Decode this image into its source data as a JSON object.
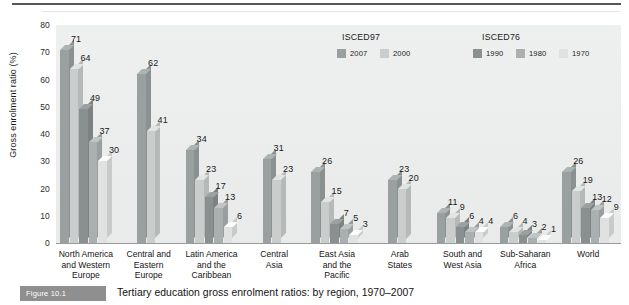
{
  "figure": {
    "caption_badge": "Figure 10.1",
    "caption_text": "Tertiary education gross enrolment ratios: by region, 1970–2007"
  },
  "legend": {
    "groups": [
      {
        "title": "ISCED97",
        "items": [
          {
            "label": "2007",
            "color": "#9aa0a0"
          },
          {
            "label": "2000",
            "color": "#c9cdcc"
          }
        ]
      },
      {
        "title": "ISCED76",
        "items": [
          {
            "label": "1990",
            "color": "#8a8f8f"
          },
          {
            "label": "1980",
            "color": "#aab0af"
          },
          {
            "label": "1970",
            "color": "#dfe2e1"
          }
        ]
      }
    ]
  },
  "chart_data": {
    "type": "bar",
    "title": "Tertiary education gross enrolment ratios: by region, 1970–2007",
    "xlabel": "",
    "ylabel": "Gross enrolment ratio (%)",
    "ylim": [
      0,
      80
    ],
    "yticks": [
      0,
      10,
      20,
      30,
      40,
      50,
      60,
      70,
      80
    ],
    "grid": false,
    "legend_position": "top-right",
    "categories": [
      "North America\nand Western\nEurope",
      "Central and\nEastern\nEurope",
      "Latin America\nand the\nCaribbean",
      "Central\nAsia",
      "East Asia\nand the\nPacific",
      "Arab\nStates",
      "South and\nWest Asia",
      "Sub-Saharan\nAfrica",
      "World"
    ],
    "series": [
      {
        "name": "2007",
        "color": "#9aa0a0",
        "values": [
          71,
          62,
          34,
          31,
          26,
          23,
          11,
          6,
          26
        ]
      },
      {
        "name": "2000",
        "color": "#c9cdcc",
        "values": [
          64,
          41,
          23,
          23,
          15,
          20,
          9,
          4,
          19
        ]
      },
      {
        "name": "1990",
        "color": "#8a8f8f",
        "values": [
          49,
          null,
          17,
          null,
          7,
          null,
          6,
          3,
          13
        ]
      },
      {
        "name": "1980",
        "color": "#aab0af",
        "values": [
          37,
          null,
          13,
          null,
          5,
          null,
          4,
          2,
          12
        ]
      },
      {
        "name": "1970",
        "color": "#dfe2e1",
        "values": [
          30,
          null,
          6,
          null,
          3,
          null,
          4,
          1,
          9
        ]
      }
    ]
  }
}
